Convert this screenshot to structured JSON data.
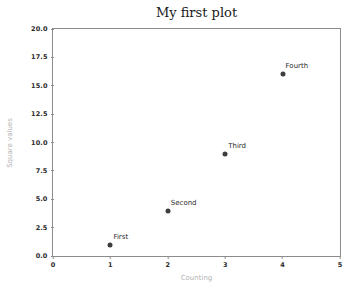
{
  "chart_data": {
    "type": "scatter",
    "title": "My first plot",
    "xlabel": "Counting",
    "ylabel": "Square values",
    "xlim": [
      0,
      5
    ],
    "ylim": [
      0,
      20
    ],
    "grid": false,
    "legend": null,
    "x": [
      1,
      2,
      3,
      4
    ],
    "y": [
      1,
      4,
      9,
      16
    ],
    "annotations": [
      "First",
      "Second",
      "Third",
      "Fourth"
    ],
    "xticks": [
      "0",
      "1",
      "2",
      "3",
      "4",
      "5"
    ],
    "xtick_values": [
      0,
      1,
      2,
      3,
      4,
      5
    ],
    "yticks": [
      "0.0",
      "2.5",
      "5.0",
      "7.5",
      "10.0",
      "12.5",
      "15.0",
      "17.5",
      "20.0"
    ],
    "ytick_values": [
      0,
      2.5,
      5,
      7.5,
      10,
      12.5,
      15,
      17.5,
      20
    ],
    "marker_color": "#3d3d3d",
    "spine_color": "#8c8c8c",
    "axis_label_color": "#b3b3b3",
    "tick_label_color": "#2b2b2b",
    "background_color": "#ffffff"
  }
}
